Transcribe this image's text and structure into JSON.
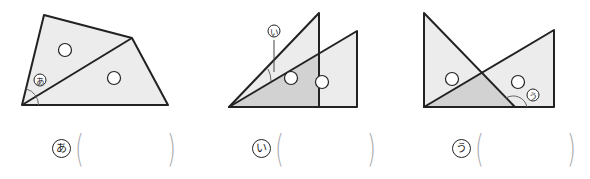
{
  "colors": {
    "line": "#222222",
    "light_fill": "#ececec",
    "dark_fill": "#d2d2d2",
    "paren": "#aaaaaa"
  },
  "figures": [
    {
      "id": "a",
      "label": "あ",
      "description": "quadrilateral split by diagonal into two triangles, angle あ marked at bottom-left vertex",
      "answer_value": ""
    },
    {
      "id": "i",
      "label": "い",
      "description": "two overlapping right triangles sharing bottom-left vertex, angle い between hypotenuses",
      "answer_value": ""
    },
    {
      "id": "u",
      "label": "う",
      "description": "two overlapping right triangles forming shaded triangle, angle う marked at bottom",
      "answer_value": ""
    }
  ]
}
